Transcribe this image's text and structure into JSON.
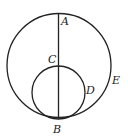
{
  "diagram": {
    "type": "geometry",
    "stroke_color": "#222222",
    "background": "#ffffff",
    "large_circle": {
      "cx": 59,
      "cy": 65.5,
      "r": 52
    },
    "small_circle": {
      "cx": 58.5,
      "cy": 92.5,
      "r": 26.5
    },
    "diameter_line": {
      "x1": 58.5,
      "y1": 13,
      "x2": 58.5,
      "y2": 119
    },
    "labels": {
      "A": "A",
      "B": "B",
      "C": "C",
      "D": "D",
      "E": "E"
    }
  }
}
